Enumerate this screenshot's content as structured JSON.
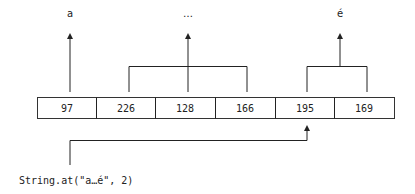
{
  "diagram": {
    "characters": [
      {
        "glyph": "a",
        "bytes": [
          0
        ]
      },
      {
        "glyph": "…",
        "bytes": [
          1,
          2,
          3
        ]
      },
      {
        "glyph": "é",
        "bytes": [
          4,
          5
        ]
      }
    ],
    "bytes": [
      "97",
      "226",
      "128",
      "166",
      "195",
      "169"
    ],
    "pointer_target_index": 4,
    "code_label": "String.at(\"a…é\", 2)"
  }
}
